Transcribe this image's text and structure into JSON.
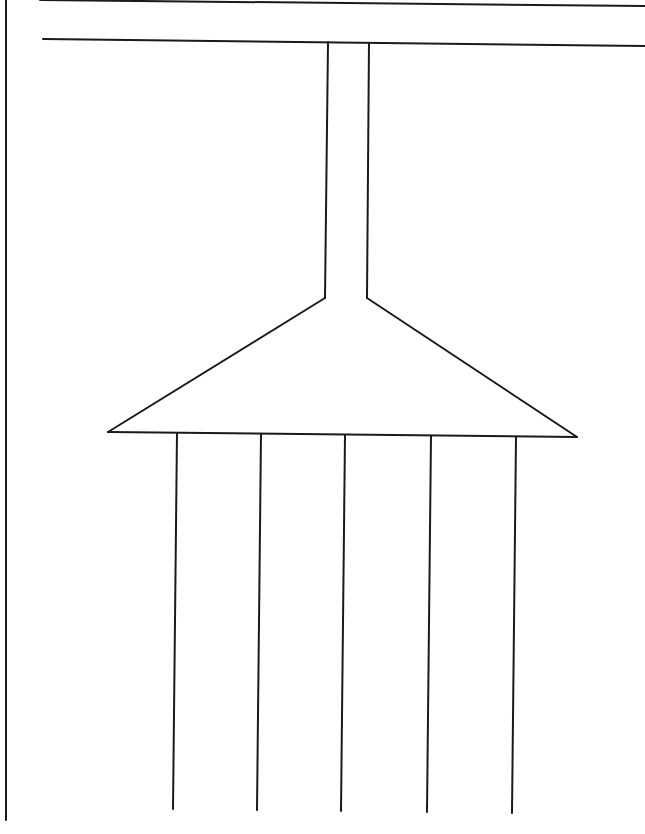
{
  "diagram": {
    "type": "manifold-line-drawing",
    "stroke_color": "#1a1a1a",
    "background": "#ffffff",
    "page_border_left": {
      "x": 6,
      "y1": 0,
      "y2": 820
    },
    "top_line": {
      "x1": 40,
      "y1": 0,
      "x2": 645,
      "y2": 6
    },
    "header_line": {
      "x1": 43,
      "y1": 39,
      "x2": 645,
      "y2": 46
    },
    "duct": {
      "left_x_top": 328,
      "right_x_top": 369,
      "top_y": 42,
      "bottom_y": 298,
      "left_x_bottom": 325,
      "right_x_bottom": 367
    },
    "triangle": {
      "apex_left": [
        325,
        298
      ],
      "apex_right": [
        367,
        298
      ],
      "base_left": [
        108,
        432
      ],
      "base_right": [
        577,
        437
      ]
    },
    "outlets": [
      {
        "x_top": 177,
        "y_top": 433,
        "x_bottom": 173,
        "y_bottom": 809
      },
      {
        "x_top": 261,
        "y_top": 434,
        "x_bottom": 257,
        "y_bottom": 810
      },
      {
        "x_top": 345,
        "y_top": 435,
        "x_bottom": 341,
        "y_bottom": 811
      },
      {
        "x_top": 431,
        "y_top": 436,
        "x_bottom": 427,
        "y_bottom": 812
      },
      {
        "x_top": 516,
        "y_top": 437,
        "x_bottom": 512,
        "y_bottom": 813
      }
    ]
  }
}
